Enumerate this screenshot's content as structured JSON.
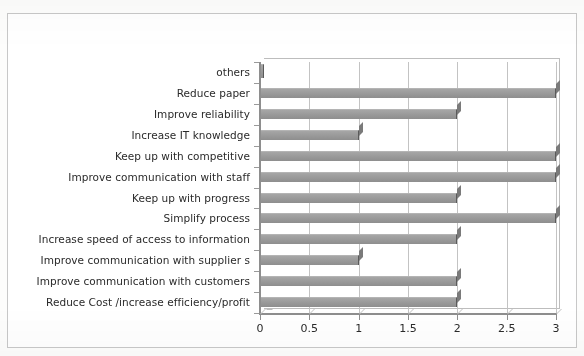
{
  "chart_data": {
    "type": "bar",
    "orientation": "horizontal",
    "title": "",
    "xlabel": "",
    "ylabel": "",
    "xlim": [
      0,
      3
    ],
    "grid": true,
    "legend": "none",
    "xticks": [
      "0",
      "0.5",
      "1",
      "1.5",
      "2",
      "2.5",
      "3"
    ],
    "xtick_values": [
      0,
      0.5,
      1,
      1.5,
      2,
      2.5,
      3
    ],
    "categories": [
      "others",
      "Reduce paper",
      "Improve reliability",
      "Increase IT knowledge",
      "Keep up with competitive",
      "Improve communication with staff",
      "Keep up with progress",
      "Simplify process",
      "Increase speed of access to information",
      "Improve communication with supplier s",
      "Improve communication with customers",
      "Reduce Cost /increase efficiency/profit"
    ],
    "values": [
      0,
      3,
      2,
      1,
      3,
      3,
      2,
      3,
      2,
      1,
      2,
      2
    ],
    "series": [
      {
        "name": "Series 1",
        "values": [
          0,
          3,
          2,
          1,
          3,
          3,
          2,
          3,
          2,
          1,
          2,
          2
        ]
      }
    ]
  },
  "style": {
    "bar_color": "#9b9b9b",
    "bar_edge_color": "#5a5a5a",
    "gridline_color": "#c3c3c3",
    "axis_color": "#8e8e8e",
    "text_color": "#2a2a2a",
    "plot_background": "#ffffff",
    "page_background": "#fdfdfc",
    "frame_color": "#c8c8c8"
  }
}
